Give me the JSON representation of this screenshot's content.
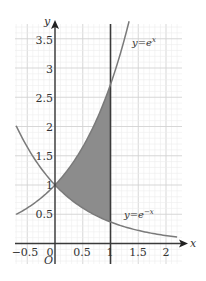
{
  "chart_data": {
    "type": "area",
    "title": "",
    "xlabel": "x",
    "ylabel": "y",
    "origin_label": "O",
    "xlim": [
      -0.7,
      2.3
    ],
    "ylim": [
      -0.3,
      3.8
    ],
    "grid": true,
    "minor_grid_step": 0.1,
    "x_ticks": [
      {
        "value": -0.5,
        "label": "−0.5"
      },
      {
        "value": 0,
        "label": "0"
      },
      {
        "value": 0.5,
        "label": "0.5"
      },
      {
        "value": 1,
        "label": "1"
      },
      {
        "value": 1.5,
        "label": "1.5"
      },
      {
        "value": 2,
        "label": "2"
      }
    ],
    "y_ticks": [
      {
        "value": 0.5,
        "label": "0.5"
      },
      {
        "value": 1,
        "label": "1"
      },
      {
        "value": 1.5,
        "label": "1.5"
      },
      {
        "value": 2,
        "label": "2"
      },
      {
        "value": 2.5,
        "label": "2.5"
      },
      {
        "value": 3,
        "label": "3"
      },
      {
        "value": 3.5,
        "label": "3.5"
      }
    ],
    "series": [
      {
        "name": "y=eˣ",
        "function": "exp(x)",
        "x_range": [
          -0.7,
          1.335
        ],
        "x": [
          -0.7,
          -0.5,
          0,
          0.5,
          1,
          1.335
        ],
        "values": [
          0.5,
          0.61,
          1.0,
          1.65,
          2.72,
          3.8
        ]
      },
      {
        "name": "y=e⁻ˣ",
        "function": "exp(-x)",
        "x_range": [
          -0.7,
          2.2
        ],
        "x": [
          -0.7,
          -0.5,
          0,
          0.5,
          1,
          1.5,
          2,
          2.2
        ],
        "values": [
          2.01,
          1.65,
          1.0,
          0.61,
          0.37,
          0.22,
          0.14,
          0.11
        ]
      }
    ],
    "vertical_line": {
      "x": 1
    },
    "shaded_region": {
      "between": [
        "y=eˣ",
        "y=e⁻ˣ"
      ],
      "x_from": 0,
      "x_to": 1,
      "color": "#8c8c8c"
    },
    "annotations": [
      {
        "text": "y=eˣ",
        "near": "upper right of exp(x) curve"
      },
      {
        "text": "y=e⁻ˣ",
        "near": "above exp(-x) curve at x≈1.4"
      }
    ]
  },
  "labels": {
    "y_axis": "y",
    "x_axis": "x",
    "origin": "O",
    "curve_exp": "y=e",
    "curve_exp_sup": "x",
    "curve_exp_neg": "y=e",
    "curve_exp_neg_sup": "−x",
    "ticks_x": [
      "−0.5",
      "0",
      "0.5",
      "1",
      "1.5",
      "2"
    ],
    "ticks_y": [
      "0.5",
      "1",
      "1.5",
      "2",
      "2.5",
      "3",
      "3.5"
    ]
  },
  "colors": {
    "curve": "#7a7a7a",
    "shade": "#8c8c8c",
    "axis": "#333333",
    "grid_major": "#d2d2d2",
    "grid_minor": "#ececec"
  }
}
